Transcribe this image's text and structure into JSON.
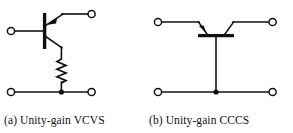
{
  "figure": {
    "background_color": "#ffffff",
    "line_color": "#111111",
    "width": 293,
    "height": 133
  },
  "panels": [
    {
      "id": "a",
      "caption": "(a) Unity-gain VCVS",
      "circuit_type": "voltage-controlled voltage source",
      "components": [
        {
          "name": "bipolar-transistor",
          "orientation": "vertical",
          "base_terminal": "left",
          "emitter_terminal": "top-right",
          "collector_terminal": "bottom-right",
          "arrow_on": "emitter",
          "arrow_direction": "toward-base"
        },
        {
          "name": "resistor",
          "style": "zigzag",
          "orientation": "vertical",
          "zigzag_peaks": 6
        }
      ],
      "terminals": [
        {
          "name": "input-positive",
          "position": "left-top"
        },
        {
          "name": "output-positive",
          "position": "right-top"
        },
        {
          "name": "input-negative",
          "position": "left-bottom"
        },
        {
          "name": "output-negative",
          "position": "right-bottom"
        }
      ],
      "junctions": [
        {
          "name": "bottom-rail-node"
        }
      ]
    },
    {
      "id": "b",
      "caption": "(b) Unity-gain CCCS",
      "circuit_type": "current-controlled current source",
      "components": [
        {
          "name": "bipolar-transistor",
          "orientation": "horizontal",
          "base_terminal": "bottom",
          "emitter_terminal": "top-left",
          "collector_terminal": "top-right",
          "arrow_on": "emitter",
          "arrow_direction": "toward-base"
        }
      ],
      "terminals": [
        {
          "name": "input-positive",
          "position": "left-top"
        },
        {
          "name": "output-positive",
          "position": "right-top"
        },
        {
          "name": "input-negative",
          "position": "left-bottom"
        },
        {
          "name": "output-negative",
          "position": "right-bottom"
        }
      ],
      "junctions": [
        {
          "name": "bottom-rail-node"
        }
      ]
    }
  ]
}
